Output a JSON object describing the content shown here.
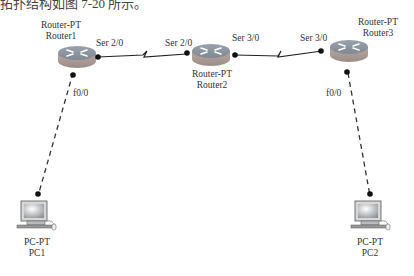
{
  "caption": "拓扑结构如图 7-20 所示。",
  "devices": [
    {
      "id": "router1",
      "model": "Router-PT",
      "name": "Router1"
    },
    {
      "id": "router2",
      "model": "Router-PT",
      "name": "Router2"
    },
    {
      "id": "router3",
      "model": "Router-PT",
      "name": "Router3"
    },
    {
      "id": "pc1",
      "model": "PC-PT",
      "name": "PC1"
    },
    {
      "id": "pc2",
      "model": "PC-PT",
      "name": "PC2"
    }
  ],
  "ports": {
    "r1_serial": "Ser 2/0",
    "r2_serial_left": "Ser 2/0",
    "r2_serial_right": "Ser 3/0",
    "r3_serial": "Ser 3/0",
    "r1_fast": "f0/0",
    "r3_fast": "f0/0"
  },
  "links": [
    {
      "from": "Router1 Ser 2/0",
      "to": "Router2 Ser 2/0",
      "type": "serial"
    },
    {
      "from": "Router2 Ser 3/0",
      "to": "Router3 Ser 3/0",
      "type": "serial"
    },
    {
      "from": "Router1 f0/0",
      "to": "PC1",
      "type": "copper-cross"
    },
    {
      "from": "Router3 f0/0",
      "to": "PC2",
      "type": "copper-cross"
    }
  ]
}
